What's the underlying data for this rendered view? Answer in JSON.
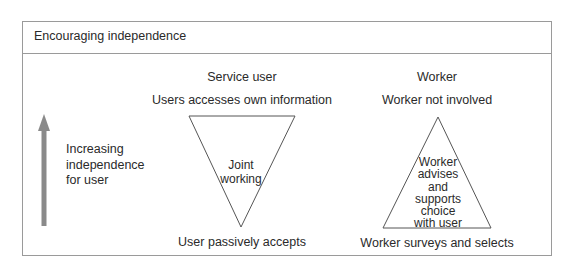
{
  "title": "Encouraging independence",
  "axis": {
    "label_lines": [
      "Increasing",
      "independence",
      "for user"
    ],
    "arrow_direction": "up",
    "arrow_color": "#888888"
  },
  "service_user": {
    "heading": "Service user",
    "top_label": "Users accesses own information",
    "triangle_label_lines": [
      "Joint",
      "working"
    ],
    "bottom_label": "User passively accepts",
    "triangle_orientation": "inverted"
  },
  "worker": {
    "heading": "Worker",
    "top_label": "Worker not involved",
    "triangle_label_lines": [
      "Worker",
      "advises",
      "and",
      "supports",
      "choice",
      "with user"
    ],
    "bottom_label": "Worker surveys and selects",
    "triangle_orientation": "upright"
  },
  "colors": {
    "border": "#9a9a9a",
    "line": "#555555",
    "text": "#2a2a2a"
  }
}
